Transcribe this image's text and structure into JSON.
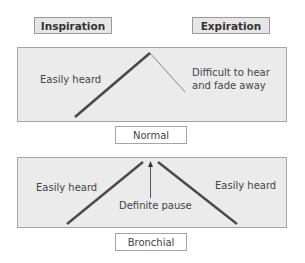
{
  "headers": {
    "inspiration": "Inspiration",
    "expiration": "Expiration"
  },
  "normal": {
    "label": "Normal",
    "inspiration_text": "Easily heard",
    "expiration_text_line1": "Difficult to hear",
    "expiration_text_line2": "and fade away"
  },
  "bronchial": {
    "label": "Bronchial",
    "inspiration_text": "Easily heard",
    "expiration_text": "Easily heard",
    "pause_text": "Definite pause"
  },
  "colors": {
    "panel_bg": "#ebebeb",
    "header_bg": "#e6e6e6",
    "line": "#4a4a4a",
    "border": "#a5a5a5"
  }
}
